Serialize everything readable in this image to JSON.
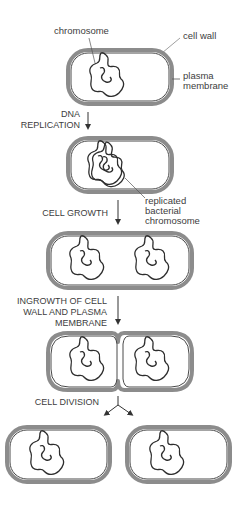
{
  "labels": {
    "chromosome": "chromosome",
    "cell_wall": "cell wall",
    "plasma_membrane_1": "plasma",
    "plasma_membrane_2": "membrane",
    "replicated_1": "replicated",
    "replicated_2": "bacterial",
    "replicated_3": "chromosome"
  },
  "steps": [
    {
      "id": "dna-replication",
      "lines": [
        "DNA",
        "REPLICATION"
      ]
    },
    {
      "id": "cell-growth",
      "lines": [
        "CELL GROWTH"
      ]
    },
    {
      "id": "ingrowth",
      "lines": [
        "INGROWTH OF CELL",
        "WALL AND PLASMA",
        "MEMBRANE"
      ]
    },
    {
      "id": "cell-division",
      "lines": [
        "CELL DIVISION"
      ]
    }
  ],
  "colors": {
    "cell_wall": "#8c8c8c",
    "membrane": "#4a4a4a",
    "chromosome": "#2e2e2e",
    "text": "#3d3d3d",
    "background": "#ffffff"
  }
}
